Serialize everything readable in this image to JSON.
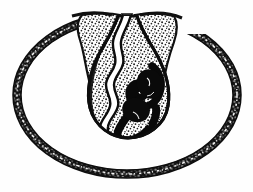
{
  "figure": {
    "domain": "Natural-Image",
    "kind": "scientific-line-engraving",
    "title": "Transverse section of seed showing outer integument ring and central embryo-bearing body",
    "medium": "woodcut / stipple engraving, black ink on white",
    "canvas": {
      "width": 253,
      "height": 192
    },
    "background_color": "#fefefe",
    "ink_color": "#111111",
    "stipple_color": "#2a2a2a",
    "parts": [
      {
        "id": "outer-ring",
        "name": "outer integument ring",
        "description": "Broad elliptical dark band with fine white hatch marks, open at top centre where it merges into the two upper lobes",
        "center": {
          "x": 127,
          "y": 96
        },
        "radius_x": 112,
        "radius_y": 82,
        "band_thickness": 7,
        "fill": "#121212"
      },
      {
        "id": "left-lobe",
        "name": "left upper lobe",
        "description": "Stippled wedge descending from the ring's top-left into the central body",
        "fill": "#ffffff",
        "stipple": true
      },
      {
        "id": "right-lobe",
        "name": "right upper lobe",
        "description": "Stippled wedge descending from the ring's top-right into the central body",
        "fill": "#ffffff",
        "stipple": true
      },
      {
        "id": "central-body",
        "name": "central pear-shaped body",
        "description": "Teardrop / pear-shaped structure, narrow above and rounded below, filled with dense stipple and bounded by a heavy dark outline",
        "bounds": {
          "x": 88,
          "y": 14,
          "width": 82,
          "height": 124
        },
        "fill": "#ffffff",
        "outline": "#101010"
      },
      {
        "id": "median-channel",
        "name": "median white channel",
        "description": "Sinuous pale furrow running from the apex notch down the left side of the central body, bordered each side by a dark line",
        "fill": "#ffffff",
        "border": "#101010"
      },
      {
        "id": "embryo",
        "name": "dark coiled embryo",
        "description": "Solid black curved / coiled mass occupying the lower right interior of the central body",
        "center": {
          "x": 138,
          "y": 98
        },
        "fill": "#080808"
      },
      {
        "id": "apex-notch",
        "name": "apex notch",
        "description": "Narrow white cleft at the very top of the figure separating the two upper lobes",
        "position": {
          "x": 128,
          "y": 16
        }
      }
    ],
    "labels": []
  }
}
